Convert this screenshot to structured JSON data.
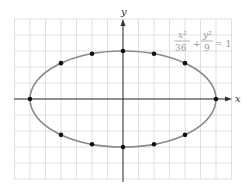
{
  "chart_data": {
    "type": "scatter",
    "title": "",
    "equation": {
      "num1": "x²",
      "den1": "36",
      "plus": "+",
      "num2": "y²",
      "den2": "9",
      "eq": "= 1"
    },
    "xlabel": "x",
    "ylabel": "y",
    "xlim": [
      -6.9,
      7.1
    ],
    "ylim": [
      -5,
      5
    ],
    "grid": true,
    "curve": {
      "type": "ellipse",
      "a": 6,
      "b": 3,
      "color": "#8a8a8a"
    },
    "points": [
      {
        "x": -6,
        "y": 0
      },
      {
        "x": 6,
        "y": 0
      },
      {
        "x": 0,
        "y": 3
      },
      {
        "x": 0,
        "y": -3
      },
      {
        "x": -2,
        "y": 2.83
      },
      {
        "x": 2,
        "y": 2.83
      },
      {
        "x": -4,
        "y": 2.24
      },
      {
        "x": 4,
        "y": 2.24
      },
      {
        "x": -2,
        "y": -2.83
      },
      {
        "x": 2,
        "y": -2.83
      },
      {
        "x": -4,
        "y": -2.24
      },
      {
        "x": 4,
        "y": -2.24
      }
    ],
    "colors": {
      "grid": "#d8d8d8",
      "axes": "#333333",
      "points": "#111111",
      "label": "#888888"
    }
  }
}
